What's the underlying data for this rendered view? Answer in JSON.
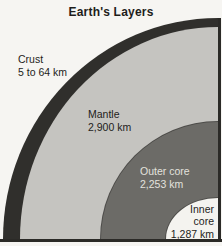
{
  "title": "Earth's Layers",
  "layers": [
    {
      "name": "Crust",
      "thickness": "5 to 64 km"
    },
    {
      "name": "Mantle",
      "thickness": "2,900 km"
    },
    {
      "name": "Outer core",
      "thickness": "2,253 km"
    },
    {
      "name": "Inner core",
      "thickness": "1,287 km"
    }
  ],
  "colors": {
    "background": "#f6f5f2",
    "crust": "#302f2c",
    "mantle": "#c5c4c0",
    "outer_core": "#6c6b67",
    "inner_core": "#f4f3ef",
    "frame": "#2b2a27",
    "arc_outline": "#4e4d4a",
    "label_dark": "#1e1d1b",
    "label_light": "#e3e2de"
  }
}
